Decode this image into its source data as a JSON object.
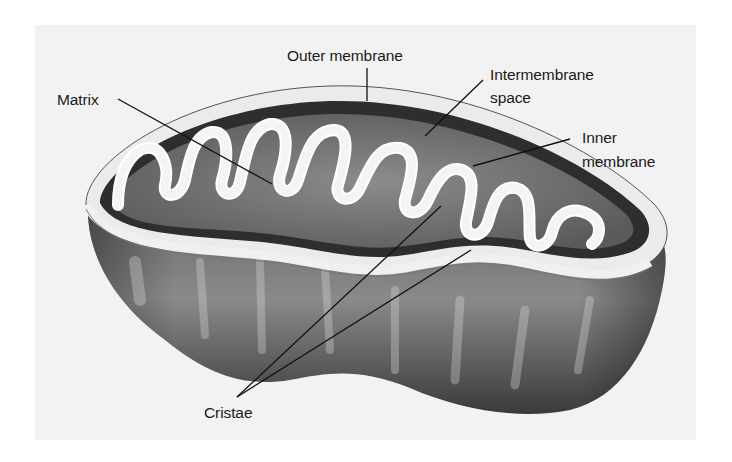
{
  "figure": {
    "colors": {
      "background": "#ffffff",
      "panel": "#f2f2f2",
      "membrane_light": "#ececec",
      "intermembrane_dark": "#2e2e2e",
      "matrix_mid": "#7a7a7a",
      "body_shadow": "#4a4a4a",
      "leader_line": "#111111",
      "label_text": "#1a1a1a"
    }
  },
  "labels": {
    "outer_membrane": "Outer membrane",
    "intermembrane_line1": "Intermembrane",
    "intermembrane_line2": "space",
    "matrix": "Matrix",
    "inner_membrane_line1": "Inner",
    "inner_membrane_line2": "membrane",
    "cristae": "Cristae"
  }
}
